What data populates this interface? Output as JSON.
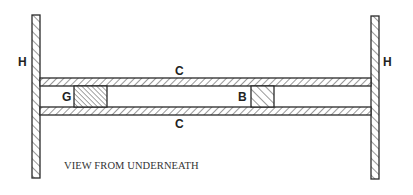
{
  "diagram": {
    "caption": "VIEW FROM UNDERNEATH",
    "labels": {
      "left_wall": "H",
      "right_wall": "H",
      "top_rail": "C",
      "bottom_rail": "C",
      "left_block": "G",
      "right_block": "B"
    },
    "colors": {
      "stroke": "#2a2a2a",
      "background": "#ffffff"
    }
  }
}
